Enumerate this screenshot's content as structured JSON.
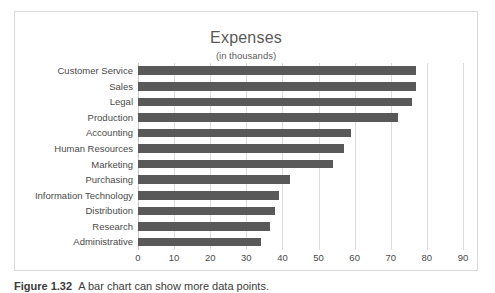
{
  "figure": {
    "caption_label": "Figure 1.32",
    "caption_text": "A bar chart can show more data points."
  },
  "chart_data": {
    "type": "bar",
    "orientation": "horizontal",
    "title": "Expenses",
    "subtitle": "(in thousands)",
    "xlabel": "",
    "ylabel": "",
    "xlim": [
      0,
      90
    ],
    "xticks": [
      0,
      10,
      20,
      30,
      40,
      50,
      60,
      70,
      80,
      90
    ],
    "xtick_labels": [
      "0",
      "10",
      "20",
      "30",
      "40",
      "50",
      "60",
      "70",
      "80",
      "90"
    ],
    "grid": "vertical",
    "legend": "none",
    "bar_color": "#595959",
    "gridline_color": "#dcdcdc",
    "categories": [
      "Customer Service",
      "Sales",
      "Legal",
      "Production",
      "Accounting",
      "Human Resources",
      "Marketing",
      "Purchasing",
      "Information Technology",
      "Distribution",
      "Research",
      "Administrative"
    ],
    "values": [
      77,
      77,
      76,
      72,
      59,
      57,
      54,
      42,
      39,
      38,
      36.5,
      34
    ]
  }
}
